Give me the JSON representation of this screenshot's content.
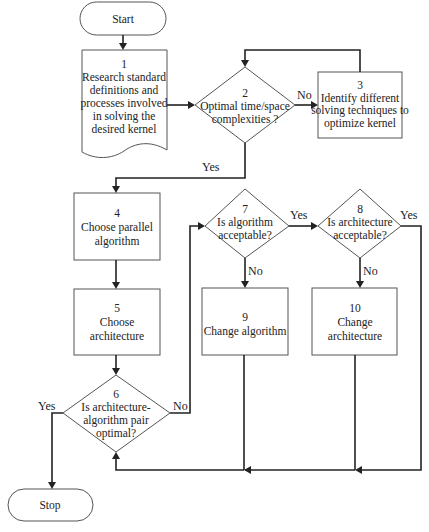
{
  "diagram": {
    "type": "flowchart",
    "nodes": {
      "start": {
        "kind": "terminator",
        "lines": [
          "Start"
        ]
      },
      "n1": {
        "kind": "document",
        "lines": [
          "1",
          "Research standard",
          "definitions and",
          "processes involved",
          "in solving the",
          "desired kernel"
        ]
      },
      "n2": {
        "kind": "decision",
        "lines": [
          "2",
          "Optimal time/space",
          "complexities ?"
        ]
      },
      "n3": {
        "kind": "process",
        "lines": [
          "3",
          "Identify different",
          "solving techniques to",
          "optimize kernel"
        ]
      },
      "n4": {
        "kind": "process",
        "lines": [
          "4",
          "Choose parallel",
          "algorithm"
        ]
      },
      "n5": {
        "kind": "process",
        "lines": [
          "5",
          "Choose",
          "architecture"
        ]
      },
      "n6": {
        "kind": "decision",
        "lines": [
          "6",
          "Is architecture-",
          "algorithm pair",
          "optimal?"
        ]
      },
      "n7": {
        "kind": "decision",
        "lines": [
          "7",
          "Is algorithm",
          "acceptable?"
        ]
      },
      "n8": {
        "kind": "decision",
        "lines": [
          "8",
          "Is architecture",
          "acceptable?"
        ]
      },
      "n9": {
        "kind": "process",
        "lines": [
          "9",
          "Change algorithm"
        ]
      },
      "n10": {
        "kind": "process",
        "lines": [
          "10",
          "Change",
          "architecture"
        ]
      },
      "stop": {
        "kind": "terminator",
        "lines": [
          "Stop"
        ]
      }
    },
    "edges": [
      {
        "from": "start",
        "to": "n1",
        "label": ""
      },
      {
        "from": "n1",
        "to": "n2",
        "label": ""
      },
      {
        "from": "n2",
        "to": "n3",
        "label": "No"
      },
      {
        "from": "n3",
        "to": "n2",
        "label": ""
      },
      {
        "from": "n2",
        "to": "n4",
        "label": "Yes"
      },
      {
        "from": "n4",
        "to": "n5",
        "label": ""
      },
      {
        "from": "n5",
        "to": "n6",
        "label": ""
      },
      {
        "from": "n6",
        "to": "stop",
        "label": "Yes"
      },
      {
        "from": "n6",
        "to": "n7",
        "label": "No"
      },
      {
        "from": "n7",
        "to": "n8",
        "label": "Yes"
      },
      {
        "from": "n7",
        "to": "n9",
        "label": "No"
      },
      {
        "from": "n8",
        "to": "n10",
        "label": "No"
      },
      {
        "from": "n8",
        "to": "n6",
        "label": "Yes"
      },
      {
        "from": "n9",
        "to": "n6",
        "label": ""
      },
      {
        "from": "n10",
        "to": "n6",
        "label": ""
      }
    ],
    "edge_labels": {
      "n2_no": "No",
      "n2_yes": "Yes",
      "n6_yes": "Yes",
      "n6_no": "No",
      "n7_yes": "Yes",
      "n7_no": "No",
      "n8_yes": "Yes",
      "n8_no": "No"
    }
  }
}
